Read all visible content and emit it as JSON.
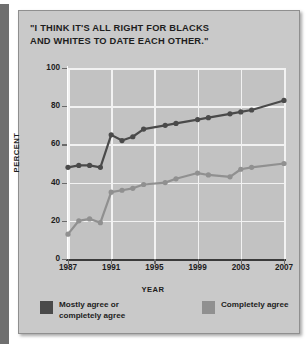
{
  "chart_data": {
    "type": "line",
    "title": "\"I THINK IT'S ALL RIGHT FOR BLACKS AND WHITES TO DATE EACH OTHER.\"",
    "title_line1": "\"I THINK IT'S ALL RIGHT FOR BLACKS",
    "title_line2": "AND WHITES TO DATE EACH OTHER.\"",
    "xlabel": "YEAR",
    "ylabel": "PERCENT",
    "ylim": [
      0,
      100
    ],
    "xlim": [
      1987,
      2007
    ],
    "yticks": [
      0,
      20,
      40,
      60,
      80,
      100
    ],
    "xticks": [
      1987,
      1991,
      1995,
      1999,
      2003,
      2007
    ],
    "grid": true,
    "legend_position": "bottom",
    "x": [
      1987,
      1988,
      1989,
      1990,
      1991,
      1992,
      1993,
      1994,
      1996,
      1997,
      1999,
      2000,
      2002,
      2003,
      2004,
      2007
    ],
    "series": [
      {
        "name": "Mostly agree or completely agree",
        "color": "#4a4a4a",
        "values": [
          48,
          49,
          49,
          48,
          65,
          62,
          64,
          68,
          70,
          71,
          73,
          74,
          76,
          77,
          78,
          83
        ]
      },
      {
        "name": "Completely agree",
        "color": "#909090",
        "values": [
          13,
          20,
          21,
          19,
          35,
          36,
          37,
          39,
          40,
          42,
          45,
          44,
          43,
          47,
          48,
          50
        ]
      }
    ]
  },
  "legend": {
    "items": [
      {
        "label": "Mostly agree or\ncompletely agree",
        "color": "#4a4a4a"
      },
      {
        "label": "Completely agree",
        "color": "#909090"
      }
    ]
  },
  "axis": {
    "y_tick_labels": [
      "100",
      "80",
      "60",
      "40",
      "20",
      "0"
    ],
    "x_tick_labels": [
      "1987",
      "1991",
      "1995",
      "1999",
      "2003",
      "2007"
    ],
    "y_axis_title": "PERCENT",
    "x_axis_title": "YEAR"
  }
}
